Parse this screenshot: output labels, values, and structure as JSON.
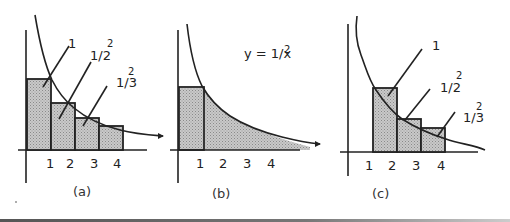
{
  "panels": [
    {
      "id": "a",
      "caption": "(a)",
      "ticks": [
        "1",
        "2",
        "3",
        "4"
      ],
      "labels": [
        {
          "base": "1",
          "sup": ""
        },
        {
          "base": "1/2",
          "sup": "2"
        },
        {
          "base": "1/3",
          "sup": "2"
        }
      ]
    },
    {
      "id": "b",
      "caption": "(b)",
      "ticks": [
        "1",
        "2",
        "3",
        "4"
      ],
      "equation": {
        "base": "y = 1/x",
        "sup": "2"
      }
    },
    {
      "id": "c",
      "caption": "(c)",
      "ticks": [
        "1",
        "2",
        "3",
        "4"
      ],
      "labels": [
        {
          "base": "1",
          "sup": ""
        },
        {
          "base": "1/2",
          "sup": "2"
        },
        {
          "base": "1/3",
          "sup": "2"
        }
      ]
    }
  ],
  "colors": {
    "ink": "#222222",
    "fill": "#bdbdbd",
    "bottom_rule": "#555555"
  }
}
